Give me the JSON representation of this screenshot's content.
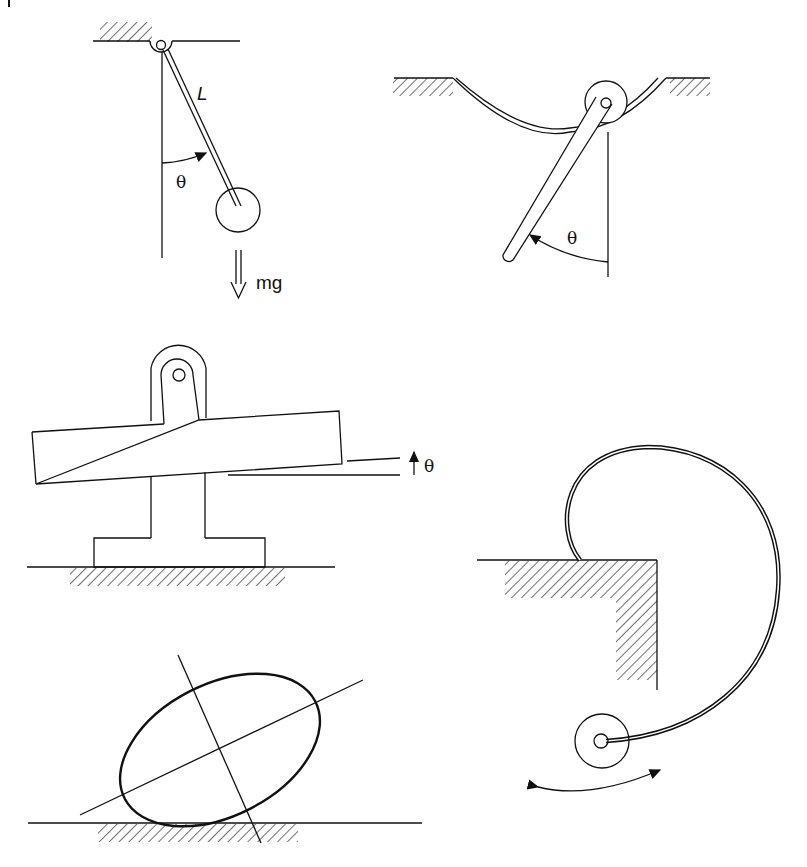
{
  "figure": {
    "corner_mark": "|",
    "panels": [
      {
        "id": "simple-pendulum",
        "labels": {
          "length": "L",
          "angle": "θ",
          "weight": "mg"
        }
      },
      {
        "id": "rod-in-curved-groove",
        "labels": {
          "angle": "θ"
        }
      },
      {
        "id": "bar-on-knife-edge-support",
        "labels": {
          "angle": "θ"
        }
      },
      {
        "id": "spiral-spring-disk",
        "labels": {}
      },
      {
        "id": "rocking-ellipse",
        "labels": {}
      }
    ]
  },
  "colors": {
    "ink": "#111111",
    "background": "#ffffff"
  }
}
